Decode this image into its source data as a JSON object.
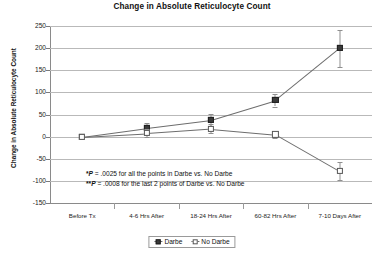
{
  "chart_data": {
    "type": "line",
    "title": "Change in Absolute Reticulocyte Count",
    "xlabel": "",
    "ylabel": "Change in Absolute Reticulocyte Count",
    "categories": [
      "Before Tx",
      "4-6 Hrs After",
      "18-24 Hrs After",
      "60-82 Hrs After",
      "7-10 Days After"
    ],
    "ylim": [
      -150,
      250
    ],
    "ytick_step": 50,
    "yticks": [
      250,
      200,
      150,
      100,
      50,
      0,
      -50,
      -100,
      -150
    ],
    "grid": true,
    "legend_position": "bottom",
    "series": [
      {
        "name": "Darbe",
        "marker": "filled-square",
        "values": [
          0,
          20,
          38,
          82,
          200
        ],
        "errors": [
          0,
          10,
          13,
          14,
          42
        ]
      },
      {
        "name": "No Darbe",
        "marker": "open-square",
        "values": [
          0,
          8,
          18,
          5,
          -78
        ],
        "errors": [
          0,
          9,
          10,
          8,
          20
        ]
      }
    ],
    "annotations": [
      "*P = .0025 for all the points in Darbe vs. No Darbe",
      "**P = .0008 for the last 2 points of Darbe vs. No Darbe"
    ]
  },
  "legend": {
    "items": [
      {
        "label": "Darbe"
      },
      {
        "label": "No Darbe"
      }
    ]
  }
}
